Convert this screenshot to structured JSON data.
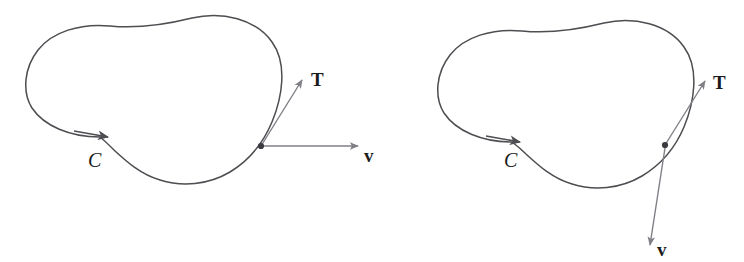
{
  "figure": {
    "caption_present": false,
    "panels": [
      {
        "id": "left-panel",
        "name": "tangent-vector-horizontal-velocity",
        "curve_label": "C",
        "tangent_label": "T",
        "velocity_label": "v",
        "point": {
          "x": 261,
          "y": 146
        },
        "curve_direction_arrow": {
          "x": 110,
          "y": 137
        },
        "tangent_vector": {
          "from_x": 261,
          "from_y": 146,
          "to_x": 304,
          "to_y": 78
        },
        "velocity_vector": {
          "from_x": 263,
          "from_y": 146,
          "to_x": 360,
          "to_y": 146
        }
      },
      {
        "id": "right-panel",
        "name": "tangent-vector-downward-velocity",
        "curve_label": "C",
        "tangent_label": "T",
        "velocity_label": "v",
        "point": {
          "x": 665,
          "y": 145
        },
        "curve_direction_arrow": {
          "x": 522,
          "y": 142
        },
        "tangent_vector": {
          "from_x": 665,
          "from_y": 145,
          "to_x": 707,
          "to_y": 79
        },
        "velocity_vector": {
          "from_x": 665,
          "from_y": 147,
          "to_x": 649,
          "to_y": 248
        }
      }
    ],
    "colors": {
      "curve_stroke": "#4d4d52",
      "arrow_stroke": "#7f7f86",
      "point_fill": "#3a3a40",
      "label_text": "#1b1b1b",
      "background": "#ffffff"
    },
    "stroke_widths": {
      "curve": 1.5,
      "arrow": 1.4
    }
  }
}
